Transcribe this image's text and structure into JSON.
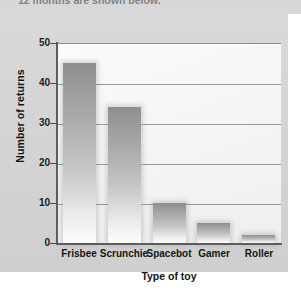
{
  "caption": {
    "text": "12 months are shown below."
  },
  "chart_data": {
    "type": "bar",
    "title": "",
    "xlabel": "Type of toy",
    "ylabel": "Number of returns",
    "categories": [
      "Frisbee",
      "Scrunchie",
      "Spacebot",
      "Gamer",
      "Roller"
    ],
    "values": [
      45,
      34,
      10,
      5,
      2
    ],
    "ylim": [
      0,
      50
    ],
    "yticks": [
      0,
      10,
      20,
      30,
      40,
      50
    ],
    "ytick_labels": [
      "0",
      "10",
      "20",
      "30",
      "40",
      "50"
    ],
    "grid": true,
    "legend": false,
    "colors": {
      "bar_top": "#8f8f8f",
      "bar_bottom": "#fdfdfd",
      "panel_background": "#d6d6d6",
      "plot_background": "#f7f7f7",
      "gridline": "#9a9a9a",
      "axis": "#5d5d5d",
      "text": "#141414"
    }
  }
}
